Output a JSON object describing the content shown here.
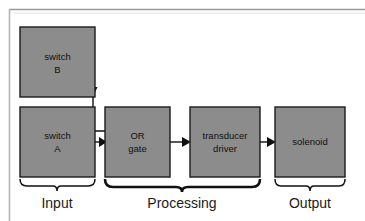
{
  "diagram": {
    "colors": {
      "box_fill": "#8c8c8c",
      "box_stroke": "#1a1a1a",
      "line": "#111111",
      "frame": "#b0b0b0",
      "background": "#ffffff",
      "text": "#111111"
    },
    "blocks": [
      {
        "id": "switch-b",
        "line1": "switch",
        "line2": "B",
        "stage": "Input",
        "x": 20,
        "y": 27,
        "w": 75,
        "h": 70
      },
      {
        "id": "switch-a",
        "line1": "switch",
        "line2": "A",
        "stage": "Input",
        "x": 20,
        "y": 107,
        "w": 75,
        "h": 70
      },
      {
        "id": "or-gate",
        "line1": "OR",
        "line2": "gate",
        "stage": "Processing",
        "x": 105,
        "y": 107,
        "w": 65,
        "h": 70
      },
      {
        "id": "transducer-driver",
        "line1": "transducer",
        "line2": "driver",
        "stage": "Processing",
        "x": 190,
        "y": 107,
        "w": 70,
        "h": 70
      },
      {
        "id": "solenoid",
        "line1": "solenoid",
        "line2": "",
        "stage": "Output",
        "x": 275,
        "y": 107,
        "w": 70,
        "h": 70
      }
    ],
    "connections": [
      {
        "id": "switch-b-to-or-gate",
        "from": "switch-b",
        "to": "or-gate",
        "style": "elbow"
      },
      {
        "id": "switch-a-to-or-gate",
        "from": "switch-a",
        "to": "or-gate",
        "style": "straight"
      },
      {
        "id": "or-gate-to-transducer-driver",
        "from": "or-gate",
        "to": "transducer-driver",
        "style": "straight"
      },
      {
        "id": "transducer-driver-to-solenoid",
        "from": "transducer-driver",
        "to": "solenoid",
        "style": "straight"
      }
    ],
    "stages": [
      {
        "id": "input",
        "label": "Input",
        "center_x": 57,
        "brace_left": 20,
        "brace_right": 95
      },
      {
        "id": "processing",
        "label": "Processing",
        "center_x": 182,
        "brace_left": 105,
        "brace_right": 260
      },
      {
        "id": "output",
        "label": "Output",
        "center_x": 310,
        "brace_left": 275,
        "brace_right": 345
      }
    ]
  }
}
